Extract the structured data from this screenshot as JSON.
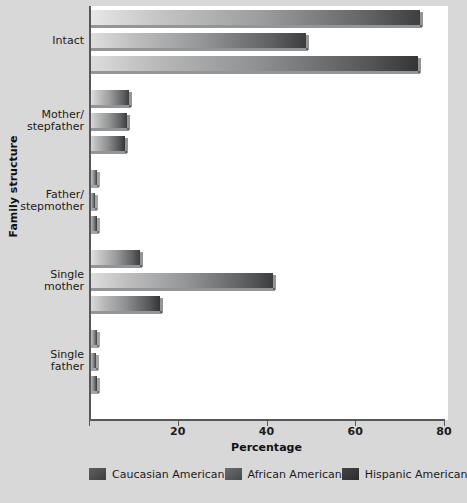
{
  "chart_data": {
    "type": "bar",
    "orientation": "horizontal",
    "title": "",
    "xlabel": "Percentage",
    "ylabel": "Family structure",
    "xlim": [
      0,
      80
    ],
    "xticks": [
      0,
      20,
      40,
      60,
      80
    ],
    "xtick_labels": [
      "",
      "20",
      "40",
      "60",
      "80"
    ],
    "grid": false,
    "legend_position": "bottom",
    "categories": [
      "Intact",
      "Mother/\nstepfather",
      "Father/\nstepmother",
      "Single\nmother",
      "Single\nfather"
    ],
    "category_lines": [
      [
        "Intact"
      ],
      [
        "Mother/",
        "stepfather"
      ],
      [
        "Father/",
        "stepmother"
      ],
      [
        "Single",
        "mother"
      ],
      [
        "Single",
        "father"
      ]
    ],
    "series": [
      {
        "name": "Caucasian American",
        "color": "#5d5f61",
        "values": [
          74.5,
          9.0,
          1.8,
          11.5,
          1.8
        ]
      },
      {
        "name": "African American",
        "color": "#6b6d6f",
        "values": [
          48.9,
          8.6,
          1.3,
          41.4,
          1.5
        ]
      },
      {
        "name": "Hispanic American",
        "color": "#424446",
        "values": [
          74.2,
          8.0,
          1.7,
          16.0,
          1.7
        ]
      }
    ]
  },
  "axis": {
    "x_title": "Percentage",
    "y_title": "Family structure",
    "tick_labels": [
      "",
      "20",
      "40",
      "60",
      "80"
    ]
  },
  "legend": {
    "items": [
      {
        "label": "Caucasian American",
        "swatch": "legend-swatch-caucasian"
      },
      {
        "label": "African American",
        "swatch": "legend-swatch-african"
      },
      {
        "label": "Hispanic American",
        "swatch": "legend-swatch-hispanic"
      }
    ]
  }
}
